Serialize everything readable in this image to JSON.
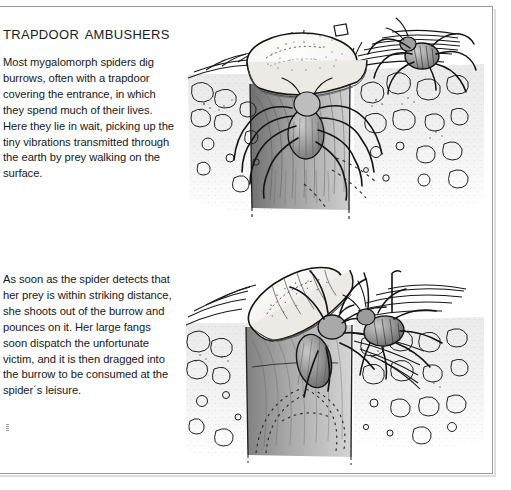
{
  "page": {
    "title": "Trapdoor ambushers",
    "background_color": "#ffffff",
    "frame_color": "#9a9a9a",
    "ink_color": "#1a1a1a"
  },
  "article": {
    "heading": "Trapdoor ambushers",
    "paragraphs": [
      "Most mygalomorph spiders dig burrows, often with a trapdoor covering the entrance, in which they spend much of their lives. Here they lie in wait, picking up the tiny vibrations transmitted through the earth by prey walking on the surface.",
      "As soon as the spider detects that her prey is within striking distance, she shoots out of the burrow and pounces on it. Her large fangs soon dispatch the unfortunate victim, and it is then dragged into the burrow to be consumed at the spider´s leisure."
    ]
  },
  "illustrations": [
    {
      "id": "burrow-cutaway-waiting",
      "name": "trapdoor-spider-waiting-in-burrow",
      "description": "Cutaway pen-and-ink drawing of a soil section showing a mygalomorph spider waiting inside its silk-lined burrow beneath a closed hinged trapdoor; a prey insect walks on the surface to the right.",
      "elements": [
        "trapdoor-lid",
        "burrow-shaft",
        "soil-cutaway",
        "pebbles",
        "surface-grass",
        "spider-in-burrow",
        "prey-insect"
      ]
    },
    {
      "id": "burrow-cutaway-striking",
      "name": "trapdoor-spider-striking-prey",
      "description": "Cutaway pen-and-ink drawing of the same burrow with the trapdoor flung open, the spider lunging out of the shaft and seizing the insect prey on the surface; dotted motion lines trail inside the burrow.",
      "elements": [
        "trapdoor-lid-open",
        "burrow-shaft",
        "soil-cutaway",
        "pebbles",
        "surface-grass",
        "spider-striking",
        "prey-insect",
        "motion-lines"
      ]
    }
  ],
  "artifacts": {
    "scan_mark": "scan-artifact"
  }
}
